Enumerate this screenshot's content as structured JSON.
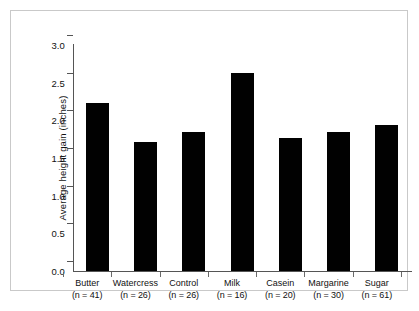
{
  "figure": {
    "background_color": "#ffffff",
    "frame_color": "#c9c9c9",
    "bar_color": "#010101",
    "axis_color": "#555555"
  },
  "chart_data": {
    "type": "bar",
    "title": "",
    "xlabel": "",
    "ylabel": "Average height gain (inches)",
    "ylim": [
      0.0,
      3.0
    ],
    "ytick_labels": [
      "0.0",
      "0.5",
      "1.0",
      "1.5",
      "2.0",
      "2.5",
      "3.0"
    ],
    "ytick_values": [
      0.0,
      0.5,
      1.0,
      1.5,
      2.0,
      2.5,
      3.0
    ],
    "grid": false,
    "legend": false,
    "categories": [
      "Butter",
      "Watercress",
      "Control",
      "Milk",
      "Casein",
      "Margarine",
      "Sugar"
    ],
    "category_sublabels": [
      "(n = 41)",
      "(n = 26)",
      "(n = 26)",
      "(n = 16)",
      "(n = 20)",
      "(n = 30)",
      "(n = 61)"
    ],
    "sample_sizes": [
      41,
      26,
      26,
      16,
      20,
      30,
      61
    ],
    "values": [
      2.23,
      1.71,
      1.85,
      2.63,
      1.77,
      1.84,
      1.94
    ],
    "bars": [
      {
        "label": "Butter",
        "sublabel": "(n = 41)",
        "value": 2.23
      },
      {
        "label": "Watercress",
        "sublabel": "(n = 26)",
        "value": 1.71
      },
      {
        "label": "Control",
        "sublabel": "(n = 26)",
        "value": 1.85
      },
      {
        "label": "Milk",
        "sublabel": "(n = 16)",
        "value": 2.63
      },
      {
        "label": "Casein",
        "sublabel": "(n = 20)",
        "value": 1.77
      },
      {
        "label": "Margarine",
        "sublabel": "(n = 30)",
        "value": 1.84
      },
      {
        "label": "Sugar",
        "sublabel": "(n = 61)",
        "value": 1.94
      }
    ]
  }
}
